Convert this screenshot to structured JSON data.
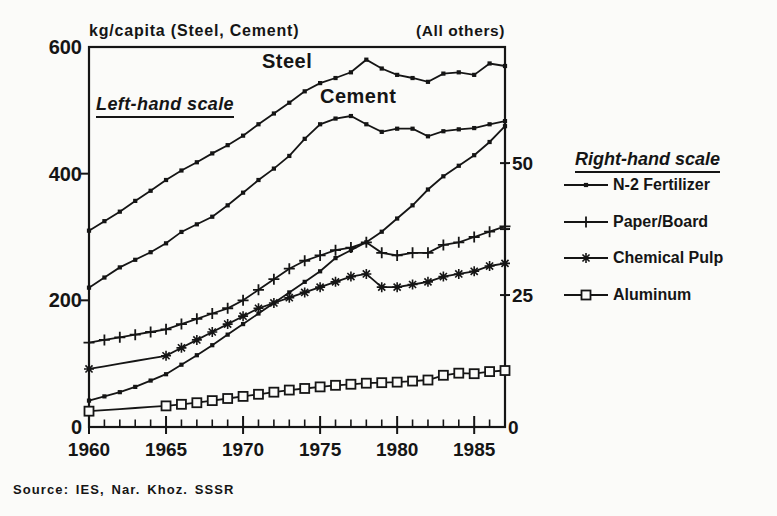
{
  "chart": {
    "title_left": "kg/capita (Steel, Cement)",
    "title_right": "(All others)",
    "left_scale_note": "Left-hand scale",
    "legend_title": "Right-hand scale",
    "source": "Source: IES, Nar. Khoz. SSSR",
    "colors": {
      "ink": "#151515",
      "background": "#fbfbf9"
    }
  },
  "chart_data": {
    "type": "line",
    "x": [
      1960,
      1961,
      1962,
      1963,
      1964,
      1965,
      1966,
      1967,
      1968,
      1969,
      1970,
      1971,
      1972,
      1973,
      1974,
      1975,
      1976,
      1977,
      1978,
      1979,
      1980,
      1981,
      1982,
      1983,
      1984,
      1985,
      1986,
      1987
    ],
    "x_ticks_labeled": [
      1960,
      1965,
      1970,
      1975,
      1980,
      1985
    ],
    "left_axis": {
      "title": "kg/capita (Steel, Cement)",
      "range": [
        0,
        600
      ],
      "ticks": [
        0,
        200,
        400,
        600
      ],
      "tick_labels": [
        "0",
        "200",
        "400",
        "600"
      ]
    },
    "right_axis": {
      "title": "(All others)",
      "range": [
        0,
        72
      ],
      "ticks": [
        0,
        25,
        50
      ],
      "minor_ticks": [
        37.5
      ],
      "tick_labels": [
        "0",
        "25",
        "50"
      ]
    },
    "grid": "off",
    "legend_position": "right",
    "series": [
      {
        "name": "Steel",
        "axis": "left",
        "marker": "dot",
        "in_legend": false,
        "values": [
          310,
          325,
          340,
          357,
          373,
          390,
          405,
          418,
          432,
          445,
          460,
          478,
          495,
          512,
          530,
          543,
          551,
          560,
          580,
          566,
          556,
          551,
          545,
          558,
          560,
          556,
          574,
          570
        ]
      },
      {
        "name": "Cement",
        "axis": "left",
        "marker": "dot",
        "in_legend": false,
        "values": [
          220,
          236,
          252,
          264,
          276,
          290,
          308,
          320,
          332,
          350,
          370,
          390,
          408,
          428,
          455,
          478,
          487,
          491,
          478,
          466,
          471,
          471,
          459,
          467,
          470,
          472,
          478,
          483
        ]
      },
      {
        "name": "N-2 Fertilizer",
        "axis": "right",
        "marker": "dot",
        "in_legend": true,
        "values": [
          5,
          5.8,
          6.6,
          7.6,
          8.8,
          10,
          11.8,
          13.6,
          15.5,
          17.5,
          19.5,
          21.5,
          23.5,
          25.5,
          27.5,
          29.5,
          32,
          33.5,
          35,
          37,
          39.5,
          42,
          45,
          47.5,
          49.5,
          51.5,
          54,
          57
        ]
      },
      {
        "name": "Paper/Board",
        "axis": "right",
        "marker": "plus",
        "in_legend": true,
        "values": [
          16,
          16.5,
          17,
          17.5,
          18,
          18.5,
          19.5,
          20.5,
          21.5,
          22.5,
          24,
          26,
          28,
          30,
          31.5,
          32.5,
          33.5,
          34,
          35,
          33,
          32.5,
          33,
          33,
          34.5,
          35,
          36,
          37,
          38
        ]
      },
      {
        "name": "Chemical Pulp",
        "axis": "right",
        "marker": "asterisk",
        "in_legend": true,
        "marker_gap_years": [
          1961,
          1962,
          1963,
          1964
        ],
        "values": [
          11,
          11.5,
          12,
          12.5,
          13,
          13.5,
          15,
          16.5,
          18,
          19.5,
          21,
          22.5,
          23.5,
          24.5,
          25.5,
          26.5,
          27.5,
          28.5,
          29,
          26.5,
          26.5,
          27,
          27.5,
          28.5,
          29,
          29.5,
          30.5,
          31
        ]
      },
      {
        "name": "Aluminum",
        "axis": "right",
        "marker": "square",
        "in_legend": true,
        "marker_gap_years": [
          1961,
          1962,
          1963,
          1964
        ],
        "values": [
          3,
          3.2,
          3.4,
          3.6,
          3.8,
          4,
          4.3,
          4.6,
          5,
          5.4,
          5.8,
          6.2,
          6.6,
          7,
          7.3,
          7.6,
          7.9,
          8.1,
          8.3,
          8.4,
          8.5,
          8.7,
          8.9,
          9.8,
          10.2,
          10.1,
          10.5,
          10.7
        ]
      }
    ],
    "legend": [
      {
        "label": "N-2 Fertilizer",
        "marker": "dot"
      },
      {
        "label": "Paper/Board",
        "marker": "plus"
      },
      {
        "label": "Chemical Pulp",
        "marker": "asterisk"
      },
      {
        "label": "Aluminum",
        "marker": "square"
      }
    ]
  }
}
